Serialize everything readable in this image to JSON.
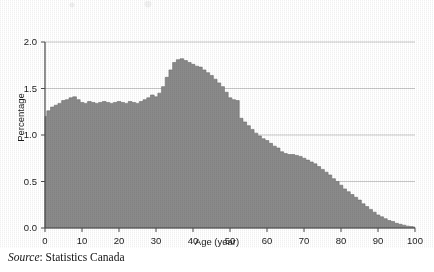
{
  "figure": {
    "source_prefix": "Source",
    "source_separator": ": ",
    "source_text": "Statistics Canada"
  },
  "colors": {
    "fill": "#8a8a8a",
    "fill_edge": "#6f6f6f",
    "axis": "#4a4a4a",
    "grid": "#b9b9b9",
    "text": "#1a1a1a",
    "background": "#ffffff"
  },
  "chart_data": {
    "type": "area",
    "title": "",
    "subtitle": "",
    "xlabel": "Age (year)",
    "ylabel": "Percentage",
    "xlim": [
      0,
      100
    ],
    "ylim": [
      0.0,
      2.0
    ],
    "xticks": [
      0,
      10,
      20,
      30,
      40,
      50,
      60,
      70,
      80,
      90,
      100
    ],
    "xtick_labels": [
      "0",
      "10",
      "20",
      "30",
      "40",
      "50",
      "60",
      "70",
      "80",
      "90",
      "100"
    ],
    "yticks": [
      0.0,
      0.5,
      1.0,
      1.5,
      2.0
    ],
    "ytick_labels": [
      "0.0",
      "0.5",
      "1.0",
      "1.5",
      "2.0"
    ],
    "grid": true,
    "grid_axis": "y",
    "legend": false,
    "legend_position": "none",
    "annotations": [],
    "series": [
      {
        "name": "Percentage of population by single year of age",
        "x": [
          0,
          1,
          2,
          3,
          4,
          5,
          6,
          7,
          8,
          9,
          10,
          11,
          12,
          13,
          14,
          15,
          16,
          17,
          18,
          19,
          20,
          21,
          22,
          23,
          24,
          25,
          26,
          27,
          28,
          29,
          30,
          31,
          32,
          33,
          34,
          35,
          36,
          37,
          38,
          39,
          40,
          41,
          42,
          43,
          44,
          45,
          46,
          47,
          48,
          49,
          50,
          51,
          52,
          53,
          54,
          55,
          56,
          57,
          58,
          59,
          60,
          61,
          62,
          63,
          64,
          65,
          66,
          67,
          68,
          69,
          70,
          71,
          72,
          73,
          74,
          75,
          76,
          77,
          78,
          79,
          80,
          81,
          82,
          83,
          84,
          85,
          86,
          87,
          88,
          89,
          90,
          91,
          92,
          93,
          94,
          95,
          96,
          97,
          98,
          99,
          100
        ],
        "values": [
          1.2,
          1.26,
          1.3,
          1.32,
          1.34,
          1.37,
          1.38,
          1.4,
          1.41,
          1.38,
          1.35,
          1.34,
          1.36,
          1.35,
          1.34,
          1.35,
          1.36,
          1.35,
          1.34,
          1.35,
          1.36,
          1.35,
          1.34,
          1.36,
          1.35,
          1.34,
          1.36,
          1.38,
          1.4,
          1.43,
          1.41,
          1.45,
          1.52,
          1.62,
          1.7,
          1.78,
          1.81,
          1.82,
          1.8,
          1.78,
          1.76,
          1.74,
          1.73,
          1.7,
          1.67,
          1.64,
          1.6,
          1.56,
          1.52,
          1.46,
          1.4,
          1.38,
          1.37,
          1.18,
          1.14,
          1.1,
          1.06,
          1.02,
          0.99,
          0.96,
          0.94,
          0.91,
          0.88,
          0.86,
          0.82,
          0.8,
          0.79,
          0.79,
          0.78,
          0.77,
          0.75,
          0.73,
          0.71,
          0.69,
          0.66,
          0.63,
          0.6,
          0.57,
          0.53,
          0.5,
          0.46,
          0.42,
          0.39,
          0.36,
          0.33,
          0.3,
          0.26,
          0.23,
          0.2,
          0.17,
          0.14,
          0.12,
          0.1,
          0.08,
          0.07,
          0.05,
          0.04,
          0.03,
          0.02,
          0.015,
          0.01
        ]
      }
    ]
  }
}
